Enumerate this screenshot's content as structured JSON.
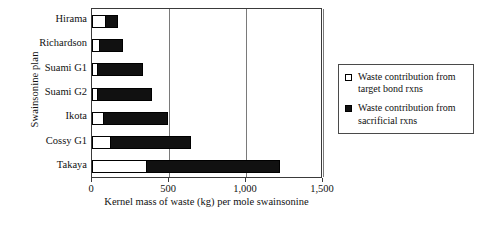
{
  "chart_data": {
    "type": "bar",
    "orientation": "horizontal",
    "stacked": true,
    "title": "",
    "xlabel": "Kernel mass of waste (kg) per mole swainsonine",
    "ylabel": "Swainsonine plan",
    "categories": [
      "Hirama",
      "Richardson",
      "Suami G1",
      "Suami G2",
      "Ikota",
      "Cossy G1",
      "Takaya"
    ],
    "xlim": [
      0,
      1500
    ],
    "xticks": [
      0,
      500,
      1000,
      1500
    ],
    "xticklabels": [
      "0",
      "500",
      "1,000",
      "1,500"
    ],
    "grid": "vertical",
    "legend_position": "right-outside",
    "series": [
      {
        "name": "Waste contribution from target bond rxns",
        "color": "#ffffff",
        "values": [
          90,
          50,
          40,
          40,
          80,
          125,
          360
        ]
      },
      {
        "name": "Waste contribution from sacrificial rxns",
        "color": "#111111",
        "values": [
          85,
          160,
          300,
          355,
          420,
          525,
          870
        ]
      }
    ],
    "totals": [
      175,
      210,
      340,
      395,
      500,
      650,
      1230
    ]
  },
  "legend": {
    "entries": [
      {
        "label": "Waste contribution from target bond rxns",
        "swatch": "light"
      },
      {
        "label": "Waste contribution from sacrificial rxns",
        "swatch": "dark"
      }
    ]
  }
}
